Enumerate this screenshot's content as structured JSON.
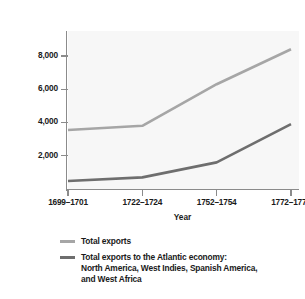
{
  "chart_data": {
    "type": "line",
    "title": "",
    "xlabel": "Year",
    "ylabel": "Value (in thousands of pounds sterling)",
    "categories": [
      "1699–1701",
      "1722–1724",
      "1752–1754",
      "1772–1774"
    ],
    "ylim": [
      0,
      9500
    ],
    "yticks": [
      2000,
      4000,
      6000,
      8000
    ],
    "ytick_labels": [
      "2,000",
      "4,000",
      "6,000",
      "8,000"
    ],
    "grid": false,
    "legend_position": "below",
    "series": [
      {
        "name": "Total exports",
        "color": "#a6a6a6",
        "values": [
          3550,
          3800,
          6300,
          8400
        ]
      },
      {
        "name": "Total exports to the Atlantic economy: North America, West Indies, Spanish America, and West Africa",
        "color": "#6e6e6e",
        "values": [
          480,
          700,
          1600,
          3900
        ]
      }
    ]
  },
  "legend": {
    "items": [
      {
        "label": "Total exports",
        "color": "#a6a6a6"
      },
      {
        "label_line1": "Total exports to the Atlantic economy:",
        "label_line2": "North America, West Indies, Spanish America,",
        "label_line3": "and West Africa",
        "color": "#6e6e6e"
      }
    ]
  },
  "colors": {
    "axis": "#8b8b8b",
    "plot_background": "#f7f7f7",
    "page_background": "#ffffff",
    "text": "#1a1a1a"
  }
}
